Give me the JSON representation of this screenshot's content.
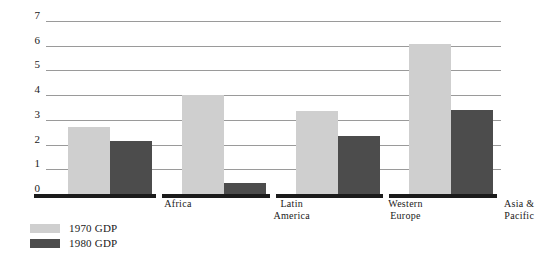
{
  "chart_data": {
    "type": "bar",
    "title": "",
    "subtitle": "",
    "xlabel": "",
    "ylabel": "",
    "ylim": [
      0,
      7
    ],
    "yticks": [
      "0",
      "1",
      "2",
      "3",
      "4",
      "5",
      "6",
      "7"
    ],
    "grid": true,
    "legend_position": "bottom-left",
    "categories": [
      "Africa",
      "Latin\nAmerica",
      "Western\nEurope",
      "Asia &\nPacific"
    ],
    "category_lines": [
      [
        "Africa"
      ],
      [
        "Latin",
        "America"
      ],
      [
        "Western",
        "Europe"
      ],
      [
        "Asia &",
        "Pacific"
      ]
    ],
    "series": [
      {
        "name": "1970 GDP",
        "color": "#cfcfcf",
        "values": [
          2.7,
          4.0,
          3.35,
          6.05
        ]
      },
      {
        "name": "1980 GDP",
        "color": "#4c4c4c",
        "values": [
          2.15,
          0.45,
          2.35,
          3.4
        ]
      }
    ]
  },
  "legend": {
    "items": [
      {
        "label": "1970 GDP",
        "swatch": "light-gray"
      },
      {
        "label": "1980 GDP",
        "swatch": "dark-gray"
      }
    ]
  },
  "colors": {
    "series_1970": "#cfcfcf",
    "series_1980": "#4c4c4c",
    "gridline": "#9a9a9a",
    "axis": "#1b1b1b",
    "background": "#ffffff",
    "text": "#1a1a1a"
  }
}
